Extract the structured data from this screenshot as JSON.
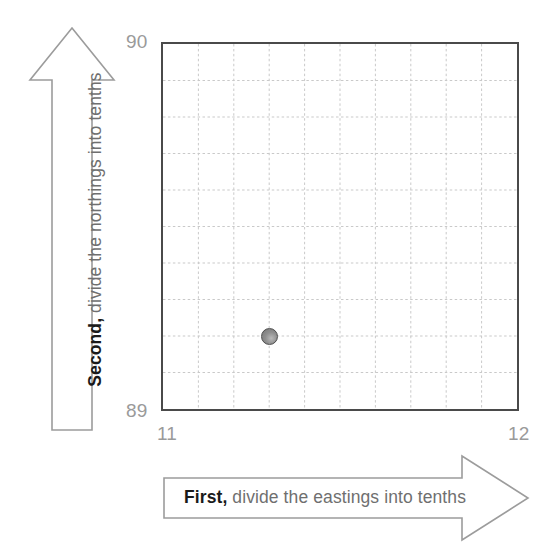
{
  "figure": {
    "background_color": "#ffffff"
  },
  "axes": {
    "y_top_label": "90",
    "y_bottom_label": "89",
    "x_left_label": "11",
    "x_right_label": "12",
    "tick_color": "#9a9a9a"
  },
  "instructions": {
    "horizontal": {
      "lead": "First,",
      "rest": " divide the eastings into tenths",
      "direction": "right"
    },
    "vertical": {
      "lead": "Second,",
      "rest": " divide the northings into tenths",
      "direction": "up"
    }
  },
  "chart_data": {
    "type": "scatter",
    "title": "",
    "xlabel": "Eastings",
    "ylabel": "Northings",
    "xlim": [
      11,
      12
    ],
    "ylim": [
      89,
      90
    ],
    "x_ticks": [
      "11",
      "12"
    ],
    "y_ticks": [
      "89",
      "90"
    ],
    "grid": true,
    "grid_divisions": 10,
    "grid_style": "dashed",
    "grid_color": "#c8c8c8",
    "border_color": "#4a4a4a",
    "points": [
      {
        "x": 11.3,
        "y": 89.2,
        "color": "#8f8f8f",
        "label": ""
      }
    ],
    "legend": "none"
  },
  "colors": {
    "arrow_outline": "#9c9c9c",
    "arrow_fill": "#ffffff",
    "text_strong": "#1a1a1a",
    "text_muted": "#6f6f6f",
    "point_fill": "#8f8f8f",
    "point_stroke": "#4d4d4d"
  }
}
